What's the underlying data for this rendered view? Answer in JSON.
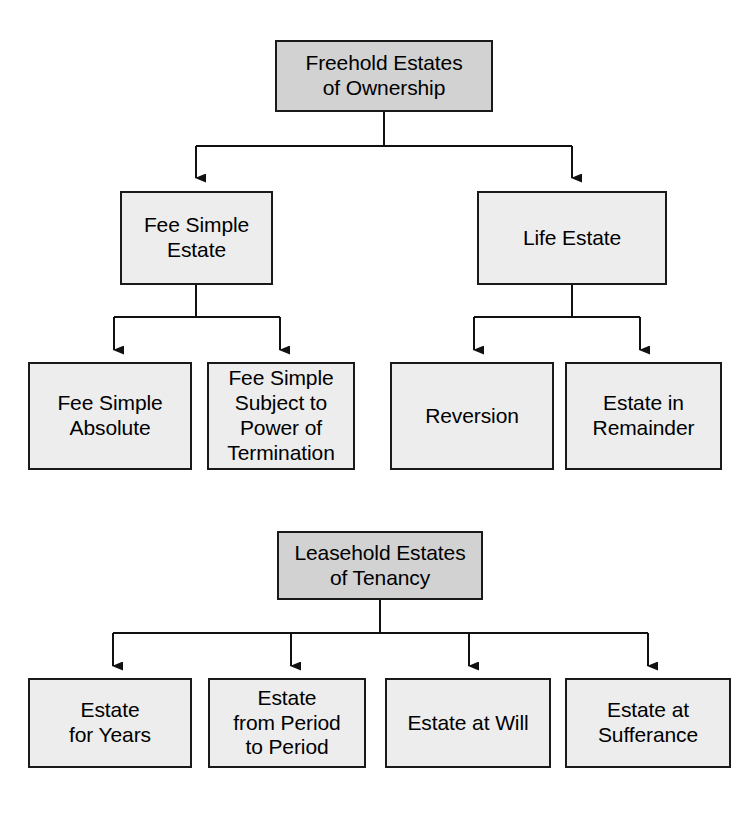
{
  "diagram": {
    "title_top": "Freehold Estates of Ownership hierarchy",
    "colors": {
      "header_fill": "#d2d2d2",
      "node_fill": "#ededed",
      "stroke": "#1a1a1a",
      "text": "#000000",
      "background": "#ffffff"
    },
    "freehold": {
      "root": {
        "label": "Freehold Estates\nof Ownership"
      },
      "level2": [
        {
          "label": "Fee Simple\nEstate"
        },
        {
          "label": "Life Estate"
        }
      ],
      "level3_fee_simple": [
        {
          "label": "Fee Simple\nAbsolute"
        },
        {
          "label": "Fee Simple\nSubject to\nPower of\nTermination"
        }
      ],
      "level3_life_estate": [
        {
          "label": "Reversion"
        },
        {
          "label": "Estate in\nRemainder"
        }
      ]
    },
    "leasehold": {
      "root": {
        "label": "Leasehold Estates\nof Tenancy"
      },
      "children": [
        {
          "label": "Estate\nfor Years"
        },
        {
          "label": "Estate\nfrom Period\nto Period"
        },
        {
          "label": "Estate at Will"
        },
        {
          "label": "Estate at\nSufferance"
        }
      ]
    }
  }
}
